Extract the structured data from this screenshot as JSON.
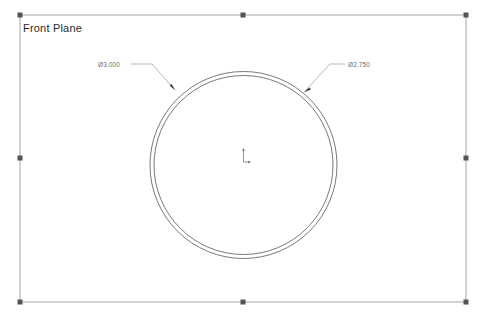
{
  "view": {
    "plane_label": "Front Plane",
    "background_color": "#ffffff",
    "geometry_color": "#5a5a5a",
    "annotation_color": "#8c8c8c",
    "handle_color": "#555555",
    "origin_color": "#707070"
  },
  "dimensions": [
    {
      "id": "outer-diameter",
      "label": "Ø3.000",
      "symbol": "Ø",
      "value": "3.000",
      "target": "outer-circle",
      "side": "left"
    },
    {
      "id": "inner-diameter",
      "label": "Ø2.750",
      "symbol": "Ø",
      "value": "2.750",
      "target": "inner-circle",
      "side": "right"
    }
  ],
  "sketch_entities": {
    "outer_circle": {
      "name": "outer-circle",
      "cx": 243.5,
      "cy": 165,
      "r": 93.5
    },
    "inner_circle": {
      "name": "inner-circle",
      "cx": 243.5,
      "cy": 165,
      "r": 89.5
    },
    "origin": {
      "name": "sketch-origin",
      "x": 243.5,
      "y": 158
    }
  },
  "boundary": {
    "name": "sketch-plane-boundary",
    "left": 20,
    "top": 15,
    "right": 466,
    "bottom": 302
  },
  "handles": [
    {
      "name": "handle-top-left",
      "x": 20,
      "y": 15
    },
    {
      "name": "handle-top-center",
      "x": 243,
      "y": 15
    },
    {
      "name": "handle-top-right",
      "x": 466,
      "y": 15
    },
    {
      "name": "handle-middle-left",
      "x": 20,
      "y": 158
    },
    {
      "name": "handle-middle-right",
      "x": 466,
      "y": 158
    },
    {
      "name": "handle-bottom-left",
      "x": 20,
      "y": 302
    },
    {
      "name": "handle-bottom-center",
      "x": 243,
      "y": 302
    },
    {
      "name": "handle-bottom-right",
      "x": 466,
      "y": 302
    }
  ],
  "leaders": {
    "outer": {
      "name": "leader-outer-diameter",
      "text_anchor_x": 131,
      "text_anchor_y": 64,
      "elbow_x": 152,
      "elbow_y": 64,
      "tip_x": 175,
      "tip_y": 90
    },
    "inner": {
      "name": "leader-inner-diameter",
      "text_anchor_x": 345,
      "text_anchor_y": 64,
      "elbow_x": 330,
      "elbow_y": 64,
      "tip_x": 304,
      "tip_y": 92
    }
  }
}
